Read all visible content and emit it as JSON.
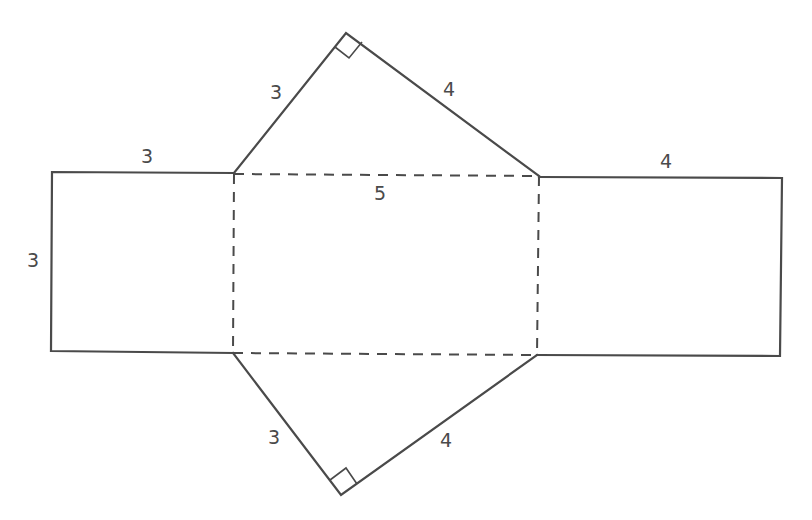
{
  "diagram": {
    "faces": {
      "left_square": {
        "width_label": "3",
        "height_label": "3"
      },
      "top_triangle": {
        "left_leg_label": "3",
        "right_leg_label": "4",
        "right_angle": true
      },
      "center_rectangle": {
        "top_label": "5",
        "fold_lines": "dashed"
      },
      "bottom_triangle": {
        "left_leg_label": "3",
        "right_leg_label": "4",
        "right_angle": true
      },
      "right_rectangle": {
        "width_label": "4"
      }
    },
    "labels": {
      "left_square_top": "3",
      "left_square_side": "3",
      "top_tri_left": "3",
      "top_tri_right": "4",
      "center_top": "5",
      "right_rect_top": "4",
      "bottom_tri_left": "3",
      "bottom_tri_right": "4"
    },
    "colors": {
      "stroke": "#4a4a4a",
      "background": "#ffffff"
    }
  }
}
